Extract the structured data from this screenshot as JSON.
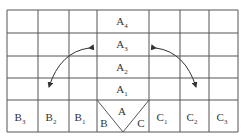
{
  "diagram": {
    "grid": {
      "x_lines": [
        7,
        38,
        69,
        97,
        149,
        180,
        209,
        238
      ],
      "y_lines": [
        10,
        33,
        56,
        78,
        100,
        132
      ],
      "line_color": "#555555"
    },
    "cells": [
      {
        "base": "A",
        "sub": "4",
        "x": 122,
        "y": 25
      },
      {
        "base": "A",
        "sub": "3",
        "x": 122,
        "y": 48
      },
      {
        "base": "A",
        "sub": "2",
        "x": 122,
        "y": 71
      },
      {
        "base": "A",
        "sub": "1",
        "x": 122,
        "y": 93
      },
      {
        "base": "A",
        "sub": "",
        "x": 122,
        "y": 115
      },
      {
        "base": "B",
        "sub": "",
        "x": 104,
        "y": 127
      },
      {
        "base": "C",
        "sub": "",
        "x": 141,
        "y": 127
      },
      {
        "base": "B",
        "sub": "3",
        "x": 20,
        "y": 121
      },
      {
        "base": "B",
        "sub": "2",
        "x": 51,
        "y": 121
      },
      {
        "base": "B",
        "sub": "1",
        "x": 80,
        "y": 121
      },
      {
        "base": "C",
        "sub": "1",
        "x": 162,
        "y": 121
      },
      {
        "base": "C",
        "sub": "2",
        "x": 192,
        "y": 121
      },
      {
        "base": "C",
        "sub": "3",
        "x": 222,
        "y": 121
      }
    ],
    "arrows": [
      {
        "name": "left-curved-arrow",
        "path": "M89,48 Q60,52 49,87"
      },
      {
        "name": "right-curved-arrow",
        "path": "M156,48 Q185,52 196,87"
      }
    ]
  }
}
